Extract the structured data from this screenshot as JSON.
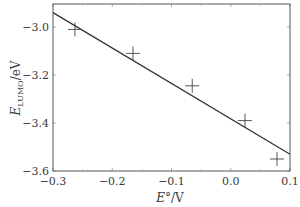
{
  "chart_data": {
    "type": "scatter",
    "title": "",
    "xlabel": "E°/V",
    "ylabel": "E_LUMO/eV",
    "xlim": [
      -0.3,
      0.1
    ],
    "ylim": [
      -3.6,
      -2.9
    ],
    "xticks": [
      -0.3,
      -0.2,
      -0.1,
      0.0,
      0.1
    ],
    "xtick_labels": [
      "−0.3",
      "−0.2",
      "−0.1",
      "0.0",
      "0.1"
    ],
    "yticks": [
      -3.6,
      -3.4,
      -3.2,
      -3.0
    ],
    "ytick_labels": [
      "−3.6",
      "−3.4",
      "−3.2",
      "−3.0"
    ],
    "grid": false,
    "legend": null,
    "series": [
      {
        "name": "data",
        "marker": "+",
        "x": [
          -0.263,
          -0.165,
          -0.065,
          0.024,
          0.078
        ],
        "y": [
          -3.01,
          -3.11,
          -3.245,
          -3.39,
          -3.55
        ]
      },
      {
        "name": "linear fit",
        "type": "line",
        "x": [
          -0.3,
          0.1
        ],
        "y": [
          -2.94,
          -3.53
        ]
      }
    ]
  },
  "axis": {
    "xlabel_main": "E",
    "xlabel_sup": "°",
    "xlabel_unit": "/V",
    "ylabel_main": "E",
    "ylabel_sub": "LUMO",
    "ylabel_unit": "/eV"
  },
  "colors": {
    "axis": "#555555",
    "line": "#333333",
    "marker": "#444444",
    "text": "#3a3a3a"
  }
}
